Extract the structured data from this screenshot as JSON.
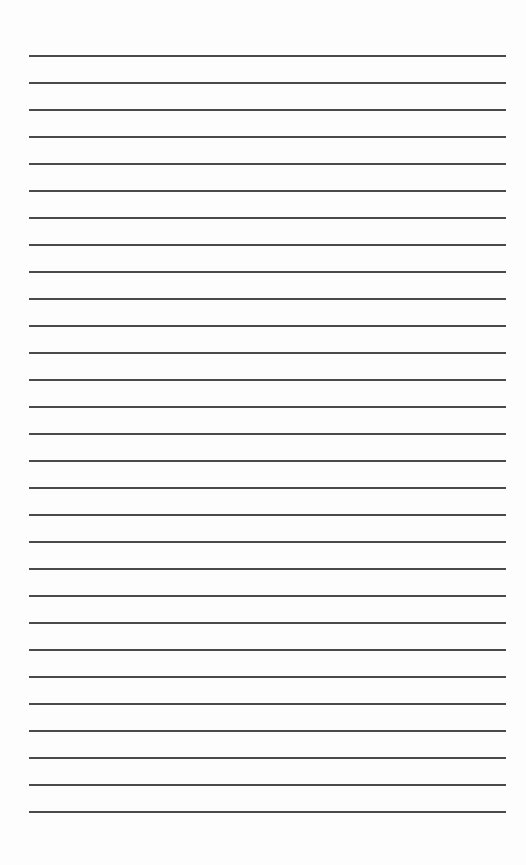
{
  "page": {
    "type": "lined-paper",
    "line_count": 29,
    "first_line_y": 55,
    "line_spacing": 27,
    "line_left": 29,
    "line_width": 477,
    "line_color": "#4a4a4a",
    "background": "#fdfdfd"
  }
}
